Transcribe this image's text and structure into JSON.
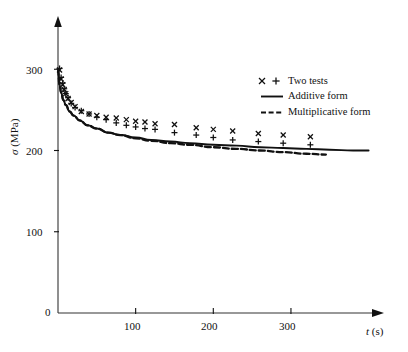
{
  "chart_data": {
    "type": "scatter",
    "title": "",
    "xlabel": "t (s)",
    "ylabel": "σ (MPa)",
    "xlim": [
      0,
      400
    ],
    "ylim": [
      0,
      350
    ],
    "xticks": [
      100,
      200,
      300
    ],
    "yticks": [
      0,
      100,
      200,
      300
    ],
    "grid": false,
    "legend_position": "upper-right",
    "legend": [
      {
        "key": "two-tests",
        "label": "Two tests",
        "marker": "x +",
        "style": "markers"
      },
      {
        "key": "additive-form",
        "label": "Additive form",
        "style": "solid-line"
      },
      {
        "key": "multiplicative-form",
        "label": "Multiplicative form",
        "style": "dashed-line"
      }
    ],
    "series": [
      {
        "name": "Test 1 (x marker)",
        "marker": "x",
        "x": [
          2,
          4,
          6,
          8,
          10,
          13,
          17,
          22,
          30,
          40,
          50,
          62,
          75,
          88,
          100,
          112,
          125,
          150,
          178,
          200,
          225,
          258,
          290,
          325
        ],
        "y": [
          299,
          288,
          281,
          275,
          270,
          264,
          259,
          254,
          248,
          245,
          243,
          241,
          240,
          238,
          236,
          235,
          233,
          232,
          228,
          226,
          224,
          221,
          219,
          217
        ]
      },
      {
        "name": "Test 2 (+ marker)",
        "marker": "+",
        "x": [
          2,
          4,
          6,
          8,
          10,
          13,
          17,
          22,
          30,
          40,
          50,
          62,
          75,
          88,
          100,
          112,
          125,
          150,
          178,
          200,
          225,
          258,
          290,
          325
        ],
        "y": [
          301,
          290,
          283,
          276,
          270,
          265,
          258,
          253,
          249,
          245,
          241,
          238,
          234,
          231,
          229,
          227,
          226,
          222,
          219,
          216,
          213,
          211,
          209,
          207
        ]
      },
      {
        "name": "Additive form",
        "style": "solid-line",
        "x": [
          0,
          2,
          4,
          7,
          10,
          15,
          20,
          28,
          38,
          50,
          65,
          80,
          100,
          120,
          145,
          170,
          200,
          230,
          260,
          290,
          320,
          350,
          380,
          400
        ],
        "y": [
          300,
          281,
          271,
          262,
          256,
          248,
          243,
          237,
          231,
          227,
          222,
          219,
          216,
          213,
          211,
          209,
          207,
          206,
          204,
          203,
          202,
          201,
          200,
          200
        ]
      },
      {
        "name": "Multiplicative form",
        "style": "dashed-line",
        "x": [
          0,
          2,
          4,
          7,
          10,
          15,
          20,
          28,
          38,
          50,
          65,
          80,
          100,
          120,
          145,
          170,
          200,
          230,
          260,
          290,
          320,
          345
        ],
        "y": [
          300,
          281,
          271,
          262,
          256,
          248,
          243,
          237,
          231,
          227,
          222,
          219,
          215,
          212,
          209,
          207,
          204,
          202,
          200,
          198,
          196,
          195
        ]
      }
    ]
  },
  "axes": {
    "y_ticks": [
      "0",
      "100",
      "200",
      "300"
    ],
    "x_ticks": [
      "100",
      "200",
      "300"
    ],
    "y_title_sigma": "σ",
    "y_title_unit": " (MPa)",
    "x_title_var": "t",
    "x_title_unit": " (s)"
  },
  "legend_text": {
    "two_tests": "Two tests",
    "additive": "Additive form",
    "multiplicative": "Multiplicative form"
  },
  "colors": {
    "ink": "#111111",
    "axis": "#333333",
    "background": "#ffffff"
  }
}
